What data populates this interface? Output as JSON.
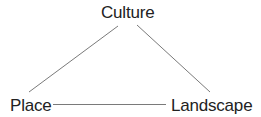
{
  "diagram": {
    "type": "triangle-relationship",
    "nodes": [
      {
        "id": "culture",
        "label": "Culture",
        "position": "top"
      },
      {
        "id": "place",
        "label": "Place",
        "position": "bottom-left"
      },
      {
        "id": "landscape",
        "label": "Landscape",
        "position": "bottom-right"
      }
    ],
    "edges": [
      {
        "from": "culture",
        "to": "place"
      },
      {
        "from": "culture",
        "to": "landscape"
      },
      {
        "from": "place",
        "to": "landscape"
      }
    ],
    "colors": {
      "text": "#222222",
      "edge": "#7a7a7a",
      "background": "#ffffff"
    }
  }
}
